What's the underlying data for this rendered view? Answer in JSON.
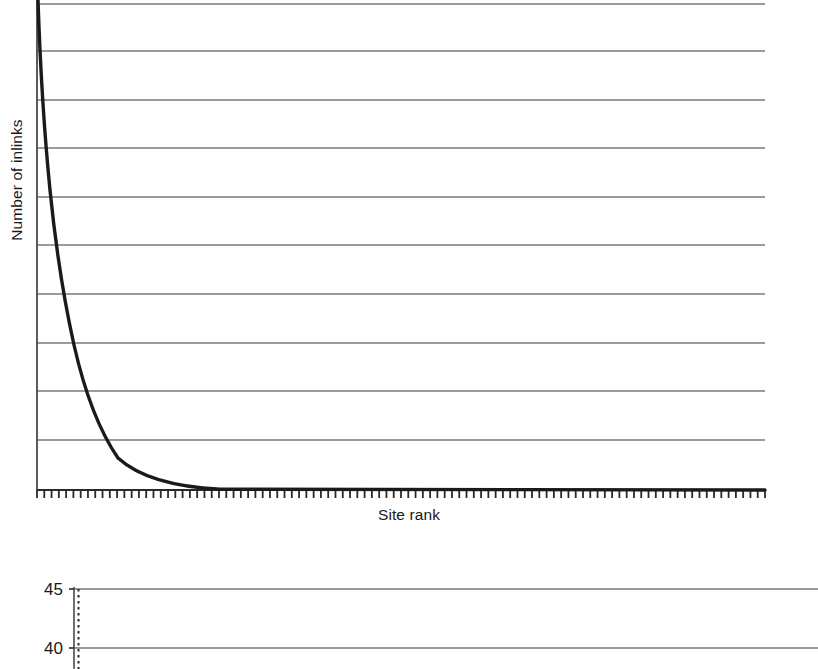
{
  "figure": {
    "kind": "two-stacked-line-charts",
    "background_color": "#ffffff",
    "line_color": "#1a1a1a",
    "grid_color": "#7a7a7a",
    "axis_color": "#4a4a4a"
  },
  "chart_data": [
    {
      "id": "top-chart",
      "type": "line",
      "title": "",
      "subtitle": "",
      "xlabel": "Site rank",
      "ylabel": "Number of inlinks",
      "grid": true,
      "grid_orientation": "horizontal",
      "gridline_count": 10,
      "legend": "none",
      "x_tick_labels": [],
      "y_tick_labels": [],
      "x_minor_tick_count": 101,
      "xlim": [
        0,
        100
      ],
      "ylim": [
        0,
        100
      ],
      "annotation": "Power-law / Zipf style decay: a few top-ranked sites hold most inlinks, with a long flat tail.",
      "series": [
        {
          "name": "Number of inlinks by site rank",
          "x": [
            0,
            1,
            2,
            3,
            4,
            5,
            6,
            7,
            8,
            9,
            10,
            12,
            14,
            16,
            18,
            20,
            24,
            28,
            32,
            36,
            40,
            50,
            60,
            70,
            80,
            90,
            100
          ],
          "y": [
            100,
            80,
            66,
            55.5,
            47.5,
            41,
            35.8,
            31.5,
            28,
            25,
            22.4,
            18.4,
            15.4,
            13,
            11.2,
            9.7,
            7.4,
            5.8,
            4.7,
            3.8,
            3.2,
            2.1,
            1.4,
            1.0,
            0.7,
            0.5,
            0.4
          ]
        }
      ]
    },
    {
      "id": "bottom-chart",
      "type": "line",
      "title": "",
      "xlabel": "",
      "ylabel": "",
      "grid": true,
      "grid_orientation": "horizontal",
      "legend": "none",
      "note": "Chart is cropped by the bottom edge of the image; only the top two y-axis ticks are visible.",
      "y_tick_labels": [
        "45",
        "40"
      ],
      "ylim": [
        40,
        45
      ],
      "x_tick_labels": [],
      "series": []
    }
  ],
  "labels": {
    "top_y_axis_title": "Number of inlinks",
    "top_x_axis_title": "Site rank",
    "bottom_y_tick_45": "45",
    "bottom_y_tick_40": "40"
  }
}
